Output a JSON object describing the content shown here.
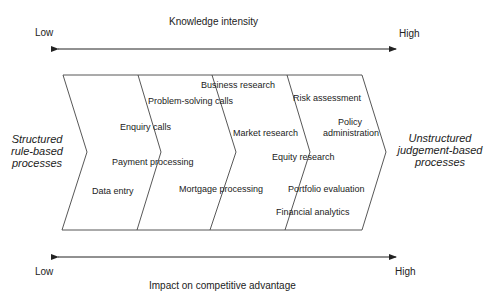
{
  "top_axis": {
    "title": "Knowledge intensity",
    "low_label": "Low",
    "high_label": "High"
  },
  "bottom_axis": {
    "title": "Impact on competitive advantage",
    "low_label": "Low",
    "high_label": "High"
  },
  "left_label": {
    "line1": "Structured",
    "line2": "rule-based",
    "line3": "processes"
  },
  "right_label": {
    "line1": "Unstructured",
    "line2": "judgement-based",
    "line3": "processes"
  },
  "processes": [
    {
      "label": "Data entry"
    },
    {
      "label": "Payment processing"
    },
    {
      "label": "Enquiry calls"
    },
    {
      "label": "Problem-solving calls"
    },
    {
      "label": "Business research"
    },
    {
      "label": "Mortgage processing"
    },
    {
      "label": "Market research"
    },
    {
      "label": "Equity research"
    },
    {
      "label": "Risk assessment"
    },
    {
      "label": "Policy"
    },
    {
      "label": "administration"
    },
    {
      "label": "Portfolio evaluation"
    },
    {
      "label": "Financial analytics"
    }
  ],
  "colors": {
    "line": "#333333",
    "text": "#222222",
    "background": "#ffffff"
  }
}
